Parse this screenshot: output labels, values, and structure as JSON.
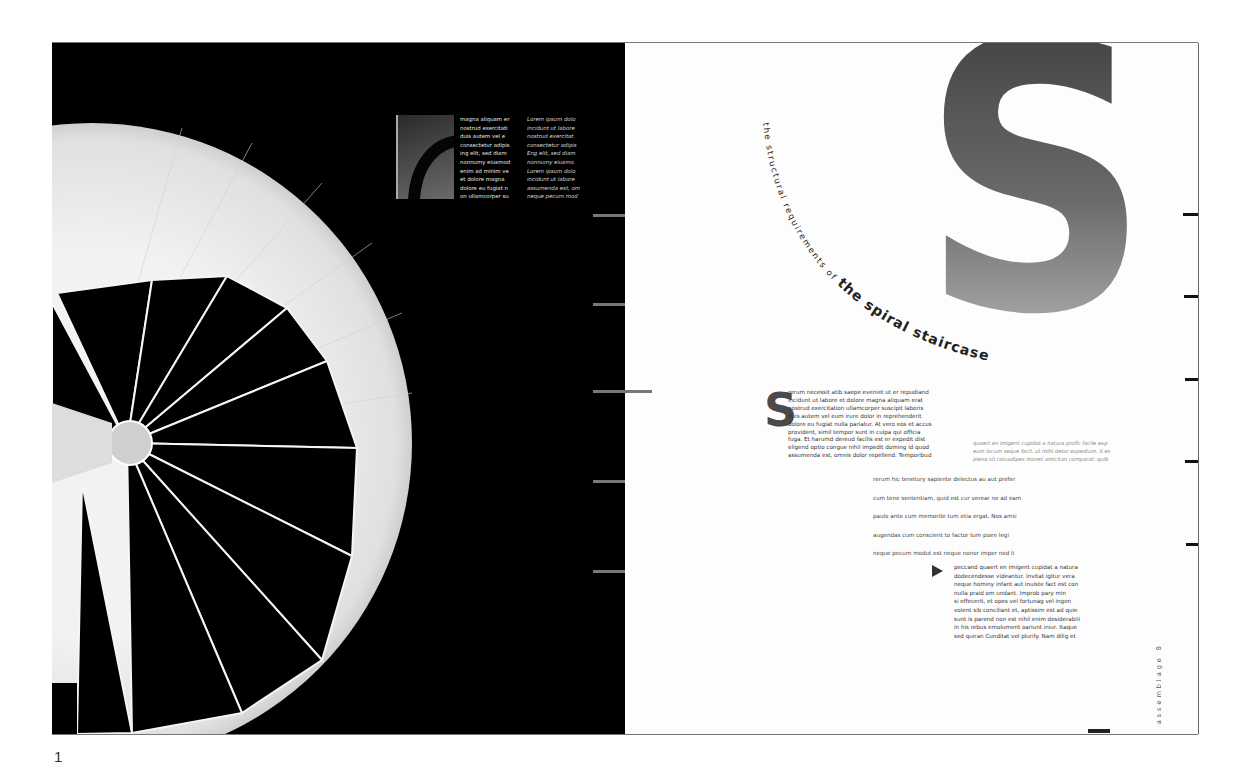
{
  "page_number": "1",
  "left_page": {
    "col1_lines": [
      "magna aliquam er",
      "nostrud exercitati",
      "duis autem vel e",
      "consectetur adipis",
      "ing elit, sed diam",
      "nonnumy eiusmod",
      "enim ad minim ve",
      "et dolore magna",
      "dolore eu fugiat n",
      "on ullamcorper su"
    ],
    "col2_lines": [
      "Lorem ipsum dolo",
      "incidunt ut labore",
      "nostrud exercitat",
      "consectetur adipis",
      "Eng elit, sed diam",
      "nonnumy eiusmo",
      "Lorem ipsum dolo",
      "incidunt ut labore",
      "assumenda est, om",
      "neque pecum mod"
    ]
  },
  "right_page": {
    "big_letter": "S",
    "title_arc": "the structural requirements of the spiral staircase",
    "drop_cap": "S",
    "body1_lines": [
      "rerum necessit atib saepe eveniet ut er repudiand",
      "incidunt ut labore et dolore magna aliquam erat",
      "nostrud exercitation ullamcorper suscipit laboris",
      "duis autem vel eum irure dolor in reprehenderit",
      "dolore eu fugiat nulla pariatur. At vero eos et accus",
      "provident, simil tempor sunt in culpa qui officia",
      "fuga. Et harumd dereud facilis est er expedit dist",
      "eligend optio congue nihil impedit doming id quod",
      "assumenda est, omnis dolor repellend. Temporibud"
    ],
    "body2_lines": [
      "quaert en imigent cupidat a natura profic facile exp",
      "eum locum seque facil. ut mihi detor expedium. it es",
      "plena sit ratuadipes monet amicitan comparat; quib"
    ],
    "body3_lines": [
      "rerum hic tenetury sapiente delectus au aut prefer",
      "cum tene sententiam, quid est cur verear ne ad eam",
      "paulo ante cum memorite tum etia ergat. Nos amic",
      "augendas cum conscient to factor tum poen legi",
      "neque pecum modut est neque nonor imper ned li"
    ],
    "body4_lines": [
      "peccand quaert en imigent cupidat a natura",
      "dodecendesse videantur. Invitat igitur vera",
      "neque hominy infant aut inuiste fact est con",
      "nulla praid om undant. Improb pary min",
      "si effecerit, et opes vel fortunag vel ingen",
      "volent sib conciliant et, aptissim est ad quie",
      "sunt is parend non est nihil enim desiderabili",
      "in his rebus emolument oariunt iniur. Itaque",
      "sed quiran Cunditat vel plurify. Nam dilig et"
    ],
    "folio": "assemblage 8"
  }
}
